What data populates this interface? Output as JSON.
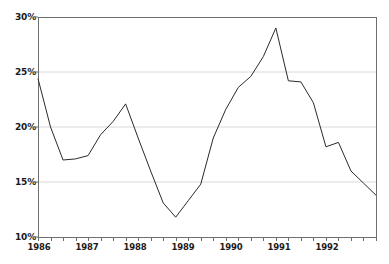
{
  "chart_data": {
    "type": "line",
    "title": "",
    "subtitle": "",
    "xlabel": "",
    "ylabel": "",
    "ylim": [
      10,
      30
    ],
    "yticks": [
      10,
      15,
      20,
      25,
      30
    ],
    "ytick_labels": [
      "10%",
      "15%",
      "20%",
      "25%",
      "30%"
    ],
    "xlim": [
      "1986 Q1",
      "1992 Q4"
    ],
    "categories": [
      "1986 Q1",
      "1986 Q2",
      "1986 Q3",
      "1986 Q4",
      "1987 Q1",
      "1987 Q2",
      "1987 Q3",
      "1987 Q4",
      "1988 Q1",
      "1988 Q2",
      "1988 Q3",
      "1988 Q4",
      "1989 Q1",
      "1989 Q2",
      "1989 Q3",
      "1989 Q4",
      "1990 Q1",
      "1990 Q2",
      "1990 Q3",
      "1990 Q4",
      "1991 Q1",
      "1991 Q2",
      "1991 Q3",
      "1991 Q4",
      "1992 Q1",
      "1992 Q2",
      "1992 Q3",
      "1992 Q4"
    ],
    "xtick_labels": [
      "1986",
      "1987",
      "1988",
      "1989",
      "1990",
      "1991",
      "1992"
    ],
    "values": [
      24.4,
      20.0,
      17.0,
      17.1,
      17.4,
      19.3,
      20.5,
      22.1,
      19.0,
      16.0,
      13.1,
      11.8,
      13.3,
      14.8,
      19.0,
      21.6,
      23.6,
      24.6,
      26.4,
      29.0,
      24.2,
      24.1,
      22.2,
      18.2,
      18.6,
      16.0,
      14.9,
      13.8
    ],
    "grid": {
      "horizontal": true,
      "vertical": false
    },
    "legend": null,
    "line_color": "#2b2b2b",
    "grid_color": "#d8d8d8",
    "axis_color": "#6e6e6e",
    "background_color": "#ffffff",
    "units": "percent"
  }
}
